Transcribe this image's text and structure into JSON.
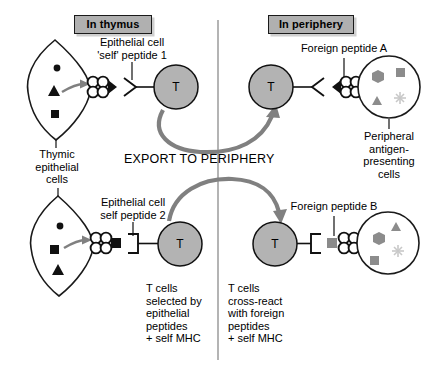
{
  "figure": {
    "title_boxes": {
      "thymus": "In thymus",
      "periphery": "In periphery"
    },
    "center_label": "EXPORT TO PERIPHERY",
    "t_cell_letter": "T",
    "labels": {
      "self_peptide_1": "Epithelial cell\n'self' peptide 1",
      "self_peptide_2": "Epithelial cell\nself peptide 2",
      "foreign_peptide_a": "Foreign peptide A",
      "foreign_peptide_b": "Foreign peptide B",
      "thymic_epithelial_cells": "Thymic\nepithelial\ncells",
      "peripheral_apc": "Peripheral\nantigen-\npresenting\ncells",
      "caption_selected": "T cells\nselected by\nepithelial\npeptides\n+ self MHC",
      "caption_crossreact": "T cells\ncross-react\nwith foreign\npeptides\n+ self MHC"
    },
    "colors": {
      "header_box_fill": "#b0b0b0",
      "header_box_shadow": "#cfcfcf",
      "t_cell_fill": "#b3b3b3",
      "outline": "#1a1a1a",
      "arrow_gray": "#808080",
      "peptide_dark": "#1a1a1a",
      "peptide_gray": "#8a8a8a",
      "apc_symbol_gray": "#8c8c8c",
      "apc_symbol_light": "#c8c8c8",
      "background": "#ffffff"
    },
    "elements": {
      "thymic_cell_top_symbols": [
        "circle",
        "triangle",
        "square"
      ],
      "thymic_cell_bottom_symbols": [
        "circle",
        "square",
        "triangle"
      ],
      "apc_top_symbols": [
        "hexagon",
        "square",
        "triangle",
        "asterisk"
      ],
      "apc_bottom_symbols": [
        "triangle",
        "hexagon",
        "square",
        "asterisk"
      ],
      "mhc_shape": "four-circle-cluster",
      "tcr_top_left": "chevron-right",
      "tcr_top_right": "chevron-left",
      "tcr_bottom_left": "bracket-right",
      "tcr_bottom_right": "bracket-left",
      "peptide_top_left": "dark-triangle",
      "peptide_top_right": "dark-triangle",
      "peptide_bottom_left": "dark-square",
      "peptide_bottom_right": "gray-square"
    }
  }
}
